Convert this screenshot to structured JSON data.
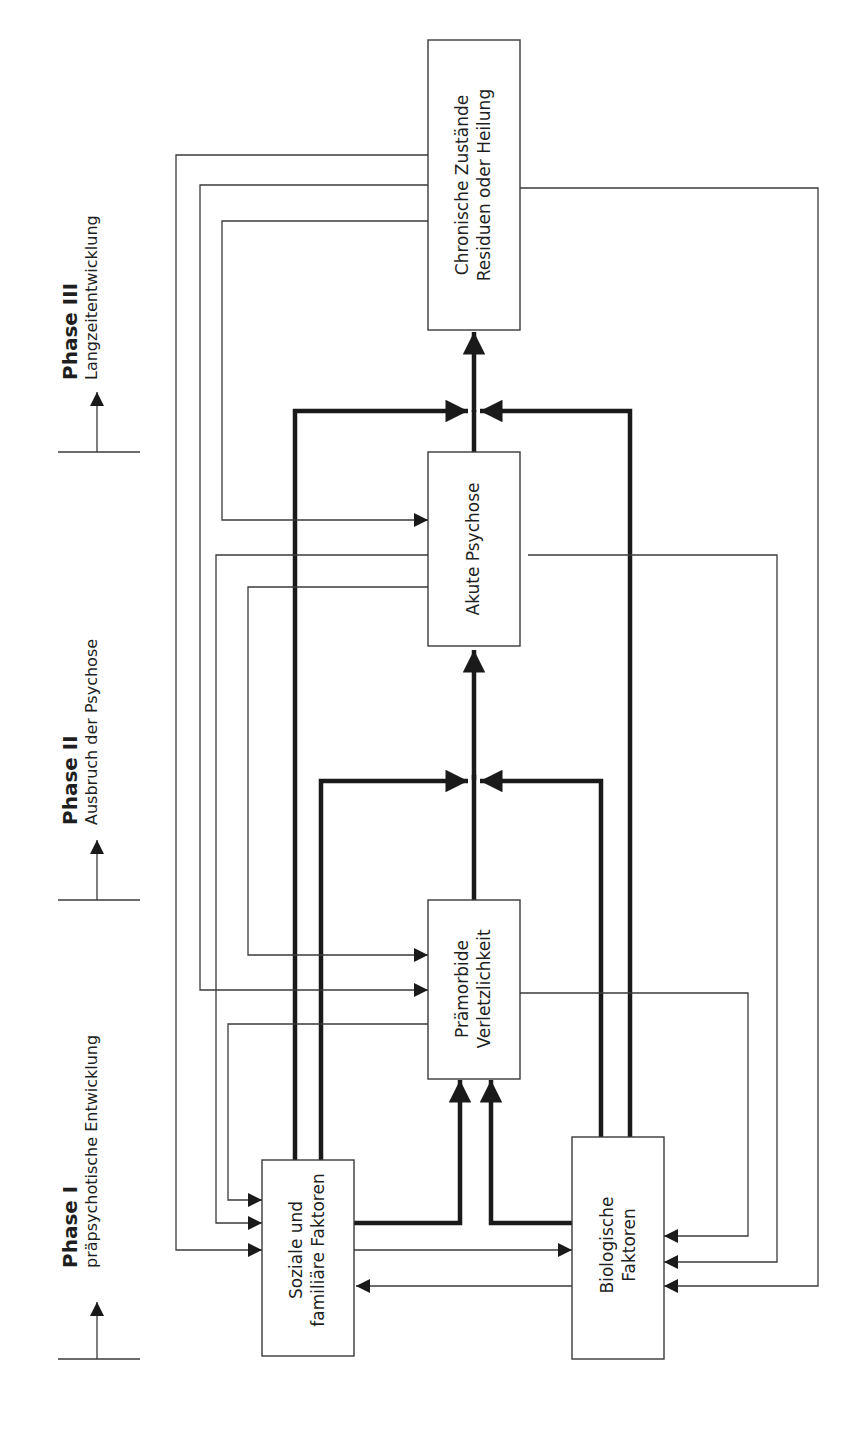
{
  "phases": [
    {
      "title": "Phase I",
      "subtitle": "präpsychotische Entwicklung"
    },
    {
      "title": "Phase II",
      "subtitle": "Ausbruch der Psychose"
    },
    {
      "title": "Phase III",
      "subtitle": "Langzeitentwicklung"
    }
  ],
  "boxes": {
    "soziale": {
      "line1": "Soziale und",
      "line2": "familiäre Faktoren"
    },
    "biologische": {
      "line1": "Biologische",
      "line2": "Faktoren"
    },
    "praemorbide": {
      "line1": "Prämorbide",
      "line2": "Verletzlichkeit"
    },
    "akute": {
      "line1": "Akute Psychose"
    },
    "chronische": {
      "line1": "Chronische Zustände",
      "line2": "Residuen oder Heilung"
    }
  },
  "colors": {
    "line": "#3a3a3a",
    "thick_line": "#1a1a1a",
    "background": "#ffffff"
  }
}
